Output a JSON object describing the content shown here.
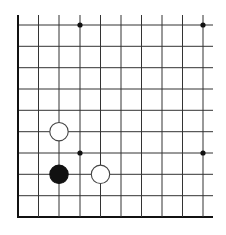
{
  "board": {
    "columns": 10,
    "rows": 10,
    "closed_edges": [
      "left",
      "bottom"
    ],
    "open_edges": [
      "top",
      "right"
    ],
    "x_positions": [
      18,
      38.5,
      59,
      80,
      100.5,
      121,
      141.5,
      162,
      182.5,
      203
    ],
    "y_positions": [
      25,
      46.3,
      67.7,
      89,
      110.3,
      131.7,
      153,
      174.3,
      195.7,
      217
    ],
    "line_color": "#333333",
    "edge_color": "#111111",
    "background": "#ffffff"
  },
  "star_points": [
    {
      "col": 3,
      "row": 0
    },
    {
      "col": 9,
      "row": 0
    },
    {
      "col": 3,
      "row": 6
    },
    {
      "col": 9,
      "row": 6
    }
  ],
  "stones": [
    {
      "color": "white",
      "col": 2,
      "row": 5
    },
    {
      "color": "black",
      "col": 2,
      "row": 7
    },
    {
      "color": "white",
      "col": 4,
      "row": 7
    }
  ]
}
